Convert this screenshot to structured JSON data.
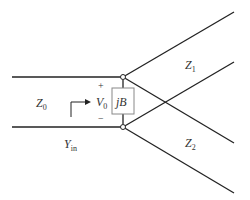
{
  "diagram": {
    "labels": {
      "z0": {
        "main": "Z",
        "sub": "0"
      },
      "z1": {
        "main": "Z",
        "sub": "1"
      },
      "z2": {
        "main": "Z",
        "sub": "2"
      },
      "v0": {
        "main": "V",
        "sub": "0"
      },
      "yin": {
        "main": "Y",
        "sub": "in"
      },
      "jb": "jB",
      "plus": "+",
      "minus": "−"
    }
  }
}
